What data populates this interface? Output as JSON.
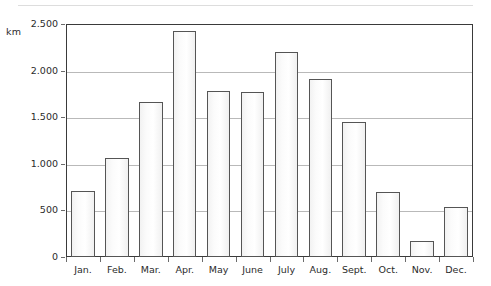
{
  "chart_data": {
    "type": "bar",
    "title": "",
    "subtitle": "",
    "xlabel": "",
    "ylabel": "km",
    "unit_label": "km",
    "categories": [
      "Jan.",
      "Feb.",
      "Mar.",
      "Apr.",
      "May",
      "June",
      "July",
      "Aug.",
      "Sept.",
      "Oct.",
      "Nov.",
      "Dec."
    ],
    "values": [
      700,
      1050,
      1650,
      2410,
      1770,
      1765,
      2190,
      1900,
      1440,
      690,
      165,
      530
    ],
    "ylim": [
      0,
      2500
    ],
    "ytick_values": [
      0,
      500,
      1000,
      1500,
      2000,
      2500
    ],
    "ytick_labels": [
      "0",
      "500",
      "1.000",
      "1.500",
      "2.000",
      "2.500"
    ],
    "grid": true,
    "gridlines_at": [
      500,
      1000,
      1500,
      2000
    ],
    "legend": null,
    "legend_position": "none",
    "series": [
      {
        "name": "km",
        "values": [
          700,
          1050,
          1650,
          2410,
          1770,
          1765,
          2190,
          1900,
          1440,
          690,
          165,
          530
        ]
      }
    ],
    "colors": {
      "bar_fill": "#fbfbfb",
      "bar_stroke": "#555555",
      "grid": "#b9b9b9",
      "frame": "#3a3a3a",
      "text": "#2b2b2b",
      "background": "#ffffff"
    }
  }
}
